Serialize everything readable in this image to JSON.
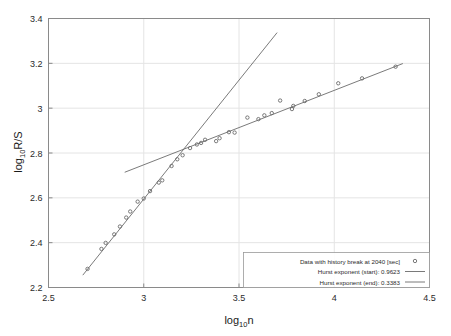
{
  "chart_data": {
    "type": "scatter",
    "title": "",
    "xlabel": "log10n",
    "xlabel_base": "log",
    "xlabel_sub": "10",
    "xlabel_tail": "n",
    "ylabel": "log10R/S",
    "ylabel_base": "log",
    "ylabel_sub": "10",
    "ylabel_tail": "R/S",
    "xlim": [
      2.5,
      4.5
    ],
    "ylim": [
      2.2,
      3.4
    ],
    "xticks": [
      "2.5",
      "3",
      "3.5",
      "4",
      "4.5"
    ],
    "xtick_values": [
      2.5,
      3.0,
      3.5,
      4.0,
      4.5
    ],
    "yticks": [
      "2.2",
      "2.4",
      "2.6",
      "2.8",
      "3",
      "3.2",
      "3.4"
    ],
    "ytick_values": [
      2.2,
      2.4,
      2.6,
      2.8,
      3.0,
      3.2,
      3.4
    ],
    "grid": true,
    "legend_position": "lower-right",
    "series": [
      {
        "name": "Data with history break at 2040 [sec]",
        "type": "scatter",
        "marker": "dot",
        "color": "#6b6b6b",
        "points": [
          [
            2.705,
            2.283
          ],
          [
            2.778,
            2.372
          ],
          [
            2.8,
            2.399
          ],
          [
            2.845,
            2.437
          ],
          [
            2.875,
            2.472
          ],
          [
            2.908,
            2.512
          ],
          [
            2.929,
            2.539
          ],
          [
            2.968,
            2.583
          ],
          [
            3.0,
            2.597
          ],
          [
            3.033,
            2.63
          ],
          [
            3.079,
            2.668
          ],
          [
            3.097,
            2.678
          ],
          [
            3.146,
            2.742
          ],
          [
            3.176,
            2.772
          ],
          [
            3.204,
            2.79
          ],
          [
            3.243,
            2.822
          ],
          [
            3.279,
            2.838
          ],
          [
            3.301,
            2.845
          ],
          [
            3.322,
            2.859
          ],
          [
            3.38,
            2.853
          ],
          [
            3.398,
            2.866
          ],
          [
            3.447,
            2.893
          ],
          [
            3.477,
            2.891
          ],
          [
            3.544,
            2.958
          ],
          [
            3.602,
            2.951
          ],
          [
            3.633,
            2.968
          ],
          [
            3.672,
            2.978
          ],
          [
            3.716,
            3.034
          ],
          [
            3.778,
            2.996
          ],
          [
            3.785,
            3.01
          ],
          [
            3.845,
            3.032
          ],
          [
            3.919,
            3.062
          ],
          [
            4.021,
            3.111
          ],
          [
            4.146,
            3.133
          ],
          [
            4.322,
            3.185
          ]
        ]
      },
      {
        "name": "Hurst exponent (start): 0.9623",
        "type": "line",
        "color": "#6b6b6b",
        "slope": 0.9623,
        "x_range": [
          2.68,
          3.7
        ],
        "y_range": [
          2.255,
          3.337
        ]
      },
      {
        "name": "Hurst exponent (end): 0.3383",
        "type": "line",
        "color": "#6b6b6b",
        "slope": 0.3383,
        "x_range": [
          2.9,
          4.36
        ],
        "y_range": [
          2.714,
          3.199
        ]
      }
    ],
    "annotations": {
      "crossover_x": 3.25,
      "crossover_y": 2.823
    }
  },
  "legend": {
    "entries": [
      {
        "label": "Data with history break at 2040 [sec]",
        "key": "marker"
      },
      {
        "label": "Hurst exponent (start): 0.9623",
        "key": "line"
      },
      {
        "label": "Hurst exponent (end): 0.3383",
        "key": "line"
      }
    ]
  },
  "colors": {
    "background": "#ffffff",
    "axis": "#8a8a8a",
    "grid": "#e4e4e4",
    "data": "#6b6b6b",
    "text": "#2b2b2b"
  }
}
